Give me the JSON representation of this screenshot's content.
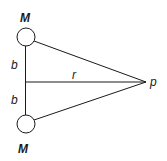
{
  "diagram": {
    "labels": {
      "mass_top": "M",
      "mass_bottom": "M",
      "half_sep_top": "b",
      "half_sep_bottom": "b",
      "distance": "r",
      "point": "p"
    },
    "colors": {
      "stroke": "#1a1a1a",
      "background": "#ffffff",
      "mass_fill": "#ffffff"
    }
  }
}
